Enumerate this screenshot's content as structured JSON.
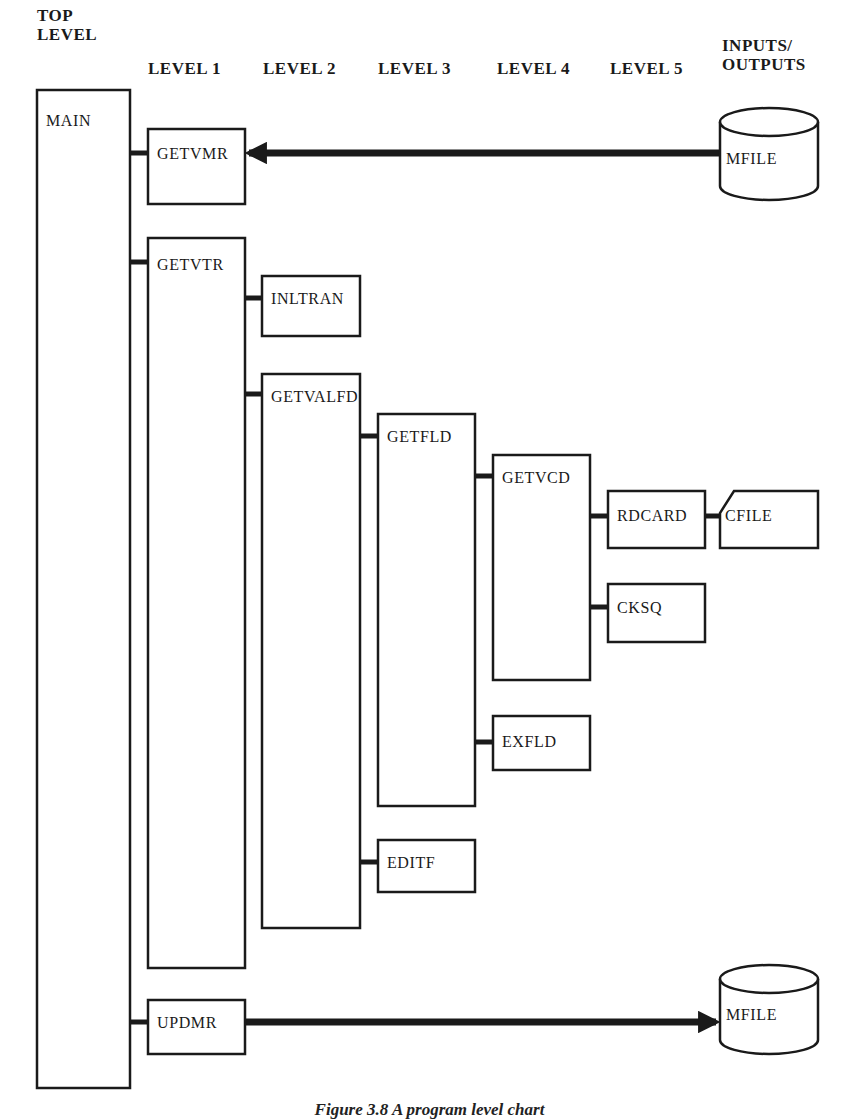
{
  "headers": [
    {
      "id": "top-level",
      "label": "TOP\nLEVEL",
      "x": 37,
      "y": 6
    },
    {
      "id": "level-1",
      "label": "LEVEL 1",
      "x": 148,
      "y": 59
    },
    {
      "id": "level-2",
      "label": "LEVEL 2",
      "x": 263,
      "y": 59
    },
    {
      "id": "level-3",
      "label": "LEVEL 3",
      "x": 378,
      "y": 59
    },
    {
      "id": "level-4",
      "label": "LEVEL 4",
      "x": 497,
      "y": 59
    },
    {
      "id": "level-5",
      "label": "LEVEL 5",
      "x": 610,
      "y": 59
    },
    {
      "id": "inputs-outputs",
      "label": "INPUTS/\nOUTPUTS",
      "x": 722,
      "y": 36
    }
  ],
  "modules": [
    {
      "id": "main",
      "label": "MAIN",
      "x": 37,
      "y": 90,
      "w": 93,
      "h": 998,
      "label_dy": 36
    },
    {
      "id": "getvmr",
      "label": "GETVMR",
      "x": 148,
      "y": 129,
      "w": 97,
      "h": 75,
      "label_dy": 30
    },
    {
      "id": "getvtr",
      "label": "GETVTR",
      "x": 148,
      "y": 238,
      "w": 97,
      "h": 730,
      "label_dy": 32
    },
    {
      "id": "inltran",
      "label": "INLTRAN",
      "x": 262,
      "y": 276,
      "w": 98,
      "h": 60,
      "label_dy": 28
    },
    {
      "id": "getvalfd",
      "label": "GETVALFD",
      "x": 262,
      "y": 374,
      "w": 98,
      "h": 554,
      "label_dy": 28
    },
    {
      "id": "getfld",
      "label": "GETFLD",
      "x": 378,
      "y": 414,
      "w": 97,
      "h": 392,
      "label_dy": 28
    },
    {
      "id": "getvcd",
      "label": "GETVCD",
      "x": 493,
      "y": 455,
      "w": 97,
      "h": 225,
      "label_dy": 28
    },
    {
      "id": "rdcard",
      "label": "RDCARD",
      "x": 608,
      "y": 491,
      "w": 97,
      "h": 57,
      "label_dy": 30
    },
    {
      "id": "cksq",
      "label": "CKSQ",
      "x": 608,
      "y": 584,
      "w": 97,
      "h": 58,
      "label_dy": 29
    },
    {
      "id": "exfld",
      "label": "EXFLD",
      "x": 493,
      "y": 716,
      "w": 97,
      "h": 54,
      "label_dy": 31
    },
    {
      "id": "editf",
      "label": "EDITF",
      "x": 378,
      "y": 840,
      "w": 97,
      "h": 52,
      "label_dy": 28
    },
    {
      "id": "updmr",
      "label": "UPDMR",
      "x": 148,
      "y": 1000,
      "w": 97,
      "h": 54,
      "label_dy": 28
    }
  ],
  "connectors": [
    {
      "from": "main",
      "to": "getvmr",
      "x1": 130,
      "x2": 148,
      "y": 153
    },
    {
      "from": "main",
      "to": "getvtr",
      "x1": 130,
      "x2": 148,
      "y": 262
    },
    {
      "from": "getvtr",
      "to": "inltran",
      "x1": 245,
      "x2": 262,
      "y": 298
    },
    {
      "from": "getvtr",
      "to": "getvalfd",
      "x1": 245,
      "x2": 262,
      "y": 394
    },
    {
      "from": "getvalfd",
      "to": "getfld",
      "x1": 360,
      "x2": 378,
      "y": 436
    },
    {
      "from": "getfld",
      "to": "getvcd",
      "x1": 475,
      "x2": 493,
      "y": 476
    },
    {
      "from": "getvcd",
      "to": "rdcard",
      "x1": 590,
      "x2": 608,
      "y": 516
    },
    {
      "from": "getvcd",
      "to": "cksq",
      "x1": 590,
      "x2": 608,
      "y": 607
    },
    {
      "from": "getfld",
      "to": "exfld",
      "x1": 475,
      "x2": 493,
      "y": 742
    },
    {
      "from": "getvalfd",
      "to": "editf",
      "x1": 360,
      "x2": 378,
      "y": 862
    },
    {
      "from": "main",
      "to": "updmr",
      "x1": 130,
      "x2": 148,
      "y": 1022
    },
    {
      "from": "rdcard",
      "to": "cfile",
      "x1": 705,
      "x2": 722,
      "y": 516
    }
  ],
  "files": [
    {
      "id": "mfile-input",
      "label": "MFILE",
      "type": "disk",
      "x": 720,
      "y": 108,
      "w": 98,
      "h": 92
    },
    {
      "id": "cfile",
      "label": "CFILE",
      "type": "card",
      "x": 720,
      "y": 491,
      "w": 98,
      "h": 57
    },
    {
      "id": "mfile-output",
      "label": "MFILE",
      "type": "disk",
      "x": 720,
      "y": 965,
      "w": 98,
      "h": 89
    }
  ],
  "flows": [
    {
      "id": "mfile-to-getvmr",
      "direction": "input",
      "from": "mfile-input",
      "to": "getvmr",
      "x_start": 720,
      "x_end": 245,
      "y": 153
    },
    {
      "id": "updmr-to-mfile",
      "direction": "output",
      "from": "updmr",
      "to": "mfile-output",
      "x_start": 245,
      "x_end": 720,
      "y": 1022
    }
  ],
  "caption": "Figure 3.8  A program level chart"
}
